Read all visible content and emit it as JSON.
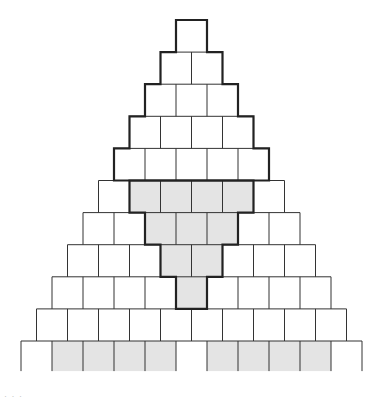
{
  "diagram": {
    "rows_from_top": [
      1,
      2,
      3,
      4,
      5,
      6,
      7,
      8,
      9,
      10,
      11
    ],
    "outlined_top_triangle": {
      "description": "Top 5 rows outlined with a bold staircase border",
      "rows": 5,
      "cells_per_row": [
        1,
        2,
        3,
        4,
        5
      ],
      "total_cells": 15
    },
    "shaded_inverted_triangle": {
      "description": "Inverted staircase region shaded gray with bold border, below the top triangle",
      "start_row": 6,
      "cells_per_row": [
        4,
        3,
        2,
        1
      ],
      "total_cells": 10
    },
    "bottom_row": {
      "row": 11,
      "open_bottom": true,
      "shaded_groups": [
        {
          "side": "left",
          "cells": 4
        },
        {
          "side": "right",
          "cells": 4
        }
      ]
    },
    "colors": {
      "line": "#333333",
      "bold_line": "#222222",
      "shade": "#e4e4e4",
      "background": "#ffffff"
    }
  },
  "caption": "· · ·"
}
